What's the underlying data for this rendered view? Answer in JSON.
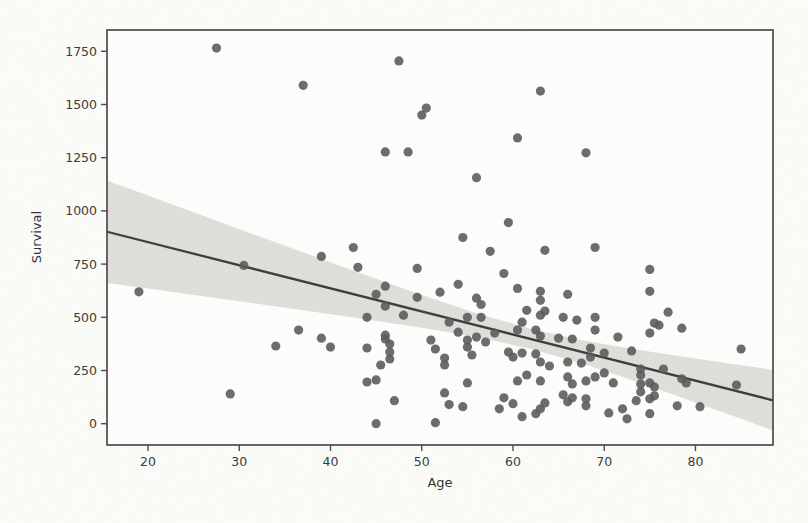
{
  "figure": {
    "kind": "scanned scatter plot figure",
    "background_color": "#fbfbf8"
  },
  "chart_data": {
    "type": "scatter",
    "title": "",
    "xlabel": "Age",
    "ylabel": "Survival",
    "xlim": [
      15.5,
      88.5
    ],
    "ylim": [
      -100,
      1850
    ],
    "x_ticks": [
      20,
      30,
      40,
      50,
      60,
      70,
      80
    ],
    "y_ticks": [
      0,
      250,
      500,
      750,
      1000,
      1250,
      1500,
      1750
    ],
    "grid": false,
    "legend": null,
    "marker": {
      "shape": "circle",
      "radius_px": 4.6
    },
    "points": [
      [
        27.5,
        1765
      ],
      [
        47.5,
        1705
      ],
      [
        37,
        1590
      ],
      [
        63,
        1563
      ],
      [
        50.5,
        1483
      ],
      [
        50,
        1450
      ],
      [
        60.5,
        1343
      ],
      [
        46,
        1277
      ],
      [
        48.5,
        1277
      ],
      [
        68,
        1273
      ],
      [
        56,
        1156
      ],
      [
        59.5,
        945
      ],
      [
        54.5,
        875
      ],
      [
        19,
        620
      ],
      [
        30.5,
        744
      ],
      [
        39,
        786
      ],
      [
        42.5,
        828
      ],
      [
        43,
        735
      ],
      [
        45,
        608
      ],
      [
        46,
        646
      ],
      [
        46,
        552
      ],
      [
        44,
        500
      ],
      [
        49.5,
        730
      ],
      [
        57.5,
        810
      ],
      [
        63.5,
        815
      ],
      [
        69,
        828
      ],
      [
        59,
        706
      ],
      [
        60.5,
        636
      ],
      [
        63,
        622
      ],
      [
        63,
        580
      ],
      [
        66,
        608
      ],
      [
        75,
        725
      ],
      [
        75,
        622
      ],
      [
        77,
        524
      ],
      [
        49.5,
        594
      ],
      [
        52,
        618
      ],
      [
        54,
        655
      ],
      [
        56,
        590
      ],
      [
        56.5,
        560
      ],
      [
        48,
        510
      ],
      [
        53,
        477
      ],
      [
        55,
        500
      ],
      [
        56.5,
        500
      ],
      [
        54,
        430
      ],
      [
        61.5,
        533
      ],
      [
        63,
        510
      ],
      [
        63.5,
        529
      ],
      [
        61,
        477
      ],
      [
        62.5,
        440
      ],
      [
        65.5,
        500
      ],
      [
        67,
        487
      ],
      [
        69,
        500
      ],
      [
        69,
        440
      ],
      [
        75.5,
        473
      ],
      [
        76,
        463
      ],
      [
        78.5,
        449
      ],
      [
        29,
        140
      ],
      [
        34,
        365
      ],
      [
        36.5,
        440
      ],
      [
        39,
        402
      ],
      [
        40,
        360
      ],
      [
        44,
        356
      ],
      [
        44,
        196
      ],
      [
        45,
        206
      ],
      [
        45,
        0
      ],
      [
        46,
        416
      ],
      [
        46,
        398
      ],
      [
        46.5,
        374
      ],
      [
        46.5,
        337
      ],
      [
        46.5,
        304
      ],
      [
        45.5,
        276
      ],
      [
        47,
        108
      ],
      [
        51,
        393
      ],
      [
        51.5,
        351
      ],
      [
        52.5,
        309
      ],
      [
        52.5,
        276
      ],
      [
        55,
        393
      ],
      [
        55,
        360
      ],
      [
        55.5,
        323
      ],
      [
        56,
        407
      ],
      [
        57,
        384
      ],
      [
        55,
        192
      ],
      [
        52.5,
        145
      ],
      [
        53,
        90
      ],
      [
        54.5,
        80
      ],
      [
        51.5,
        5
      ],
      [
        58,
        426
      ],
      [
        60.5,
        440
      ],
      [
        63,
        412
      ],
      [
        65,
        402
      ],
      [
        66.5,
        398
      ],
      [
        68.5,
        356
      ],
      [
        59.5,
        337
      ],
      [
        60,
        313
      ],
      [
        61,
        332
      ],
      [
        62.5,
        328
      ],
      [
        63,
        290
      ],
      [
        64,
        271
      ],
      [
        66,
        290
      ],
      [
        67.5,
        285
      ],
      [
        68.5,
        313
      ],
      [
        60.5,
        201
      ],
      [
        61.5,
        229
      ],
      [
        63,
        201
      ],
      [
        66,
        220
      ],
      [
        66.5,
        187
      ],
      [
        68,
        201
      ],
      [
        69,
        220
      ],
      [
        59,
        122
      ],
      [
        60,
        94
      ],
      [
        58.5,
        70
      ],
      [
        61,
        33
      ],
      [
        62.5,
        47
      ],
      [
        63,
        70
      ],
      [
        63.5,
        98
      ],
      [
        65.5,
        136
      ],
      [
        66,
        103
      ],
      [
        66.5,
        122
      ],
      [
        68,
        117
      ],
      [
        68,
        84
      ],
      [
        71.5,
        407
      ],
      [
        75,
        426
      ],
      [
        73,
        342
      ],
      [
        70,
        332
      ],
      [
        70,
        239
      ],
      [
        71,
        192
      ],
      [
        74,
        257
      ],
      [
        74,
        229
      ],
      [
        74,
        187
      ],
      [
        74,
        150
      ],
      [
        75,
        192
      ],
      [
        75.5,
        173
      ],
      [
        75.5,
        131
      ],
      [
        76.5,
        257
      ],
      [
        78.5,
        211
      ],
      [
        79,
        192
      ],
      [
        73.5,
        108
      ],
      [
        75,
        117
      ],
      [
        72,
        70
      ],
      [
        70.5,
        51
      ],
      [
        72.5,
        23
      ],
      [
        75,
        47
      ],
      [
        78,
        84
      ],
      [
        80.5,
        80
      ],
      [
        85,
        351
      ],
      [
        84.5,
        182
      ]
    ],
    "regression_line": {
      "x": [
        15.5,
        88.5
      ],
      "y": [
        902,
        110
      ],
      "slope": -10.84,
      "intercept": 1070
    },
    "confidence_band": {
      "x": [
        15.5,
        20,
        26,
        32,
        38,
        44,
        50,
        56,
        62,
        68,
        74,
        80,
        85,
        88.5
      ],
      "upper": [
        1143,
        1072,
        977,
        883,
        789,
        696,
        605,
        519,
        445,
        389,
        345,
        306,
        275,
        253
      ],
      "lower": [
        661,
        635,
        599,
        564,
        527,
        490,
        451,
        407,
        351,
        277,
        191,
        100,
        23,
        -32
      ]
    },
    "colors": {
      "point": "#595959",
      "regression_line": "#3e3e3e",
      "confidence_band": "#d6d6d3",
      "axis_spine": "#4b4b4b",
      "tick_label": "#3a3a3a",
      "axis_title": "#333333",
      "background": "#fbfbf8"
    }
  }
}
